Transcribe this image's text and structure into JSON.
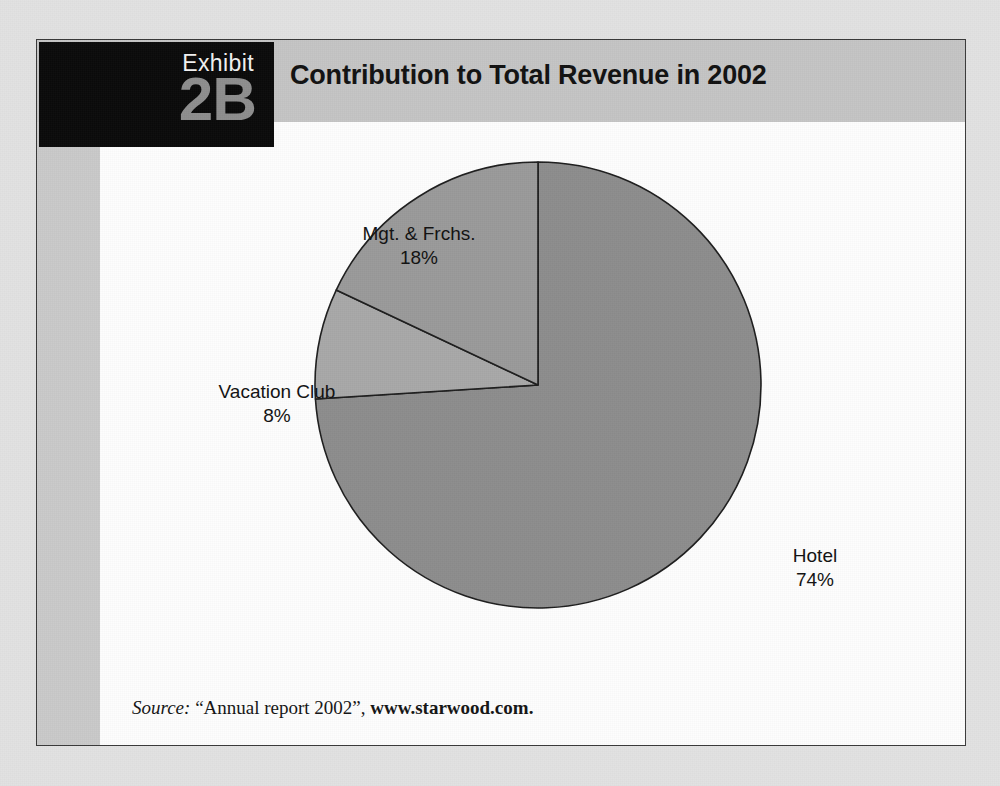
{
  "page": {
    "background_color": "#e2e2e2"
  },
  "exhibit": {
    "badge_word": "Exhibit",
    "badge_number": "2B",
    "badge_bg_color": "#0a0a0a",
    "badge_word_color": "#f2f2f2",
    "badge_number_color": "#8e8e8e",
    "title": "Contribution to Total Revenue in 2002",
    "header_band_color": "#c4c4c4",
    "card_border_color": "#3a3a3a",
    "card_bg_color": "#c9c9c9",
    "body_bg_color": "#fdfdfd"
  },
  "source": {
    "prefix": "Source:",
    "citation": "“Annual report 2002”,",
    "url": "www.starwood.com."
  },
  "chart_data": {
    "type": "pie",
    "title": "Contribution to Total Revenue in 2002",
    "xlabel": "",
    "ylabel": "",
    "legend": "none",
    "grid": false,
    "start_angle_deg": 0,
    "direction": "clockwise",
    "categories": [
      "Hotel",
      "Vacation Club",
      "Mgt. & Frchs."
    ],
    "values": [
      74,
      8,
      18
    ],
    "unit": "%",
    "slices": [
      {
        "name": "Hotel",
        "value": 74,
        "value_label": "74%",
        "color": "#8d8d8d",
        "start_deg": 0,
        "end_deg": 266.4
      },
      {
        "name": "Vacation Club",
        "value": 8,
        "value_label": "8%",
        "color": "#a8a8a8",
        "start_deg": 266.4,
        "end_deg": 295.2
      },
      {
        "name": "Mgt. & Frchs.",
        "value": 18,
        "value_label": "18%",
        "color": "#9a9a9a",
        "start_deg": 295.2,
        "end_deg": 360
      }
    ],
    "stroke_color": "#1d1d1d",
    "stroke_width": 1.6
  }
}
